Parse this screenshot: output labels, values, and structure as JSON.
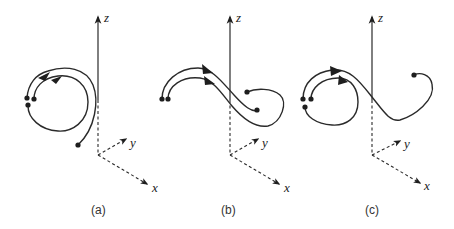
{
  "figure": {
    "panels": [
      {
        "id": "a",
        "caption": "(a)",
        "axes": {
          "z_label": "z",
          "y_label": "y",
          "x_label": "x"
        },
        "description": "Two nested looping trajectories forming a circular loop, each with a directional arrowhead"
      },
      {
        "id": "b",
        "caption": "(b)",
        "axes": {
          "z_label": "z",
          "y_label": "y",
          "x_label": "x"
        },
        "description": "Two parallel S-shaped trajectories crossing the z-axis, ending in a loop"
      },
      {
        "id": "c",
        "caption": "(c)",
        "axes": {
          "z_label": "z",
          "y_label": "y",
          "x_label": "x"
        },
        "description": "Circular loop trajectories connected to an S-curve ending at a single point"
      }
    ],
    "colors": {
      "ink": "#2a2a2a",
      "background": "#ffffff"
    }
  }
}
